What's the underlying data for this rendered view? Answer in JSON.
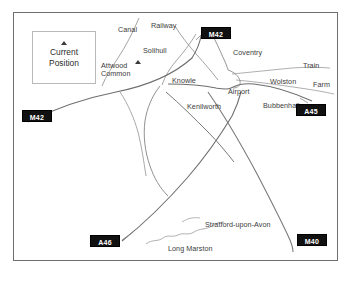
{
  "map": {
    "title": "Current Position map",
    "frame": {
      "border_color": "#6f6f6f"
    },
    "current_position": {
      "line1": "Current",
      "line2": "Position",
      "marker_icon": "triangle-marker-icon"
    },
    "road_badges": [
      {
        "id": "badge-m42-top",
        "label": "M42",
        "x": 201,
        "y": 27
      },
      {
        "id": "badge-m42-left",
        "label": "M42",
        "x": 22,
        "y": 110
      },
      {
        "id": "badge-a45",
        "label": "A45",
        "x": 296,
        "y": 104
      },
      {
        "id": "badge-a46",
        "label": "A46",
        "x": 90,
        "y": 235
      },
      {
        "id": "badge-m40",
        "label": "M40",
        "x": 297,
        "y": 234
      }
    ],
    "place_labels": [
      {
        "id": "label-canal",
        "text": "Canal",
        "x": 118,
        "y": 26
      },
      {
        "id": "label-railway",
        "text": "Railway",
        "x": 151,
        "y": 22
      },
      {
        "id": "label-solihull",
        "text": "Solihull",
        "x": 143,
        "y": 47
      },
      {
        "id": "label-attwood-common",
        "text": "Attwood Common",
        "x": 101,
        "y": 62
      },
      {
        "id": "label-knowle",
        "text": "Knowle",
        "x": 172,
        "y": 77
      },
      {
        "id": "label-kenilworth",
        "text": "Kenilworth",
        "x": 187,
        "y": 103
      },
      {
        "id": "label-coventry",
        "text": "Coventry",
        "x": 233,
        "y": 49
      },
      {
        "id": "label-airport",
        "text": "Airport",
        "x": 228,
        "y": 88
      },
      {
        "id": "label-bubbenhall",
        "text": "Bubbenhall",
        "x": 263,
        "y": 102
      },
      {
        "id": "label-wolston",
        "text": "Wolston",
        "x": 270,
        "y": 78
      },
      {
        "id": "label-train",
        "text": "Train",
        "x": 303,
        "y": 62
      },
      {
        "id": "label-farm",
        "text": "Farm",
        "x": 313,
        "y": 81
      },
      {
        "id": "label-stratford-upon-avon",
        "text": "Stratford-upon-Avon",
        "x": 205,
        "y": 221
      },
      {
        "id": "label-long-marston",
        "text": "Long Marston",
        "x": 168,
        "y": 245
      }
    ],
    "markers": [
      {
        "id": "marker-attwood-common",
        "icon": "triangle-marker-icon",
        "x": 135,
        "y": 60
      }
    ],
    "colors": {
      "road": "#8a8a8a",
      "road_dark": "#5e5e5e",
      "dashed_feature": "#9a9a9a",
      "badge_bg": "#111111",
      "badge_text": "#ffffff",
      "label_text": "#3b3b3b",
      "frame": "#6f6f6f"
    }
  }
}
